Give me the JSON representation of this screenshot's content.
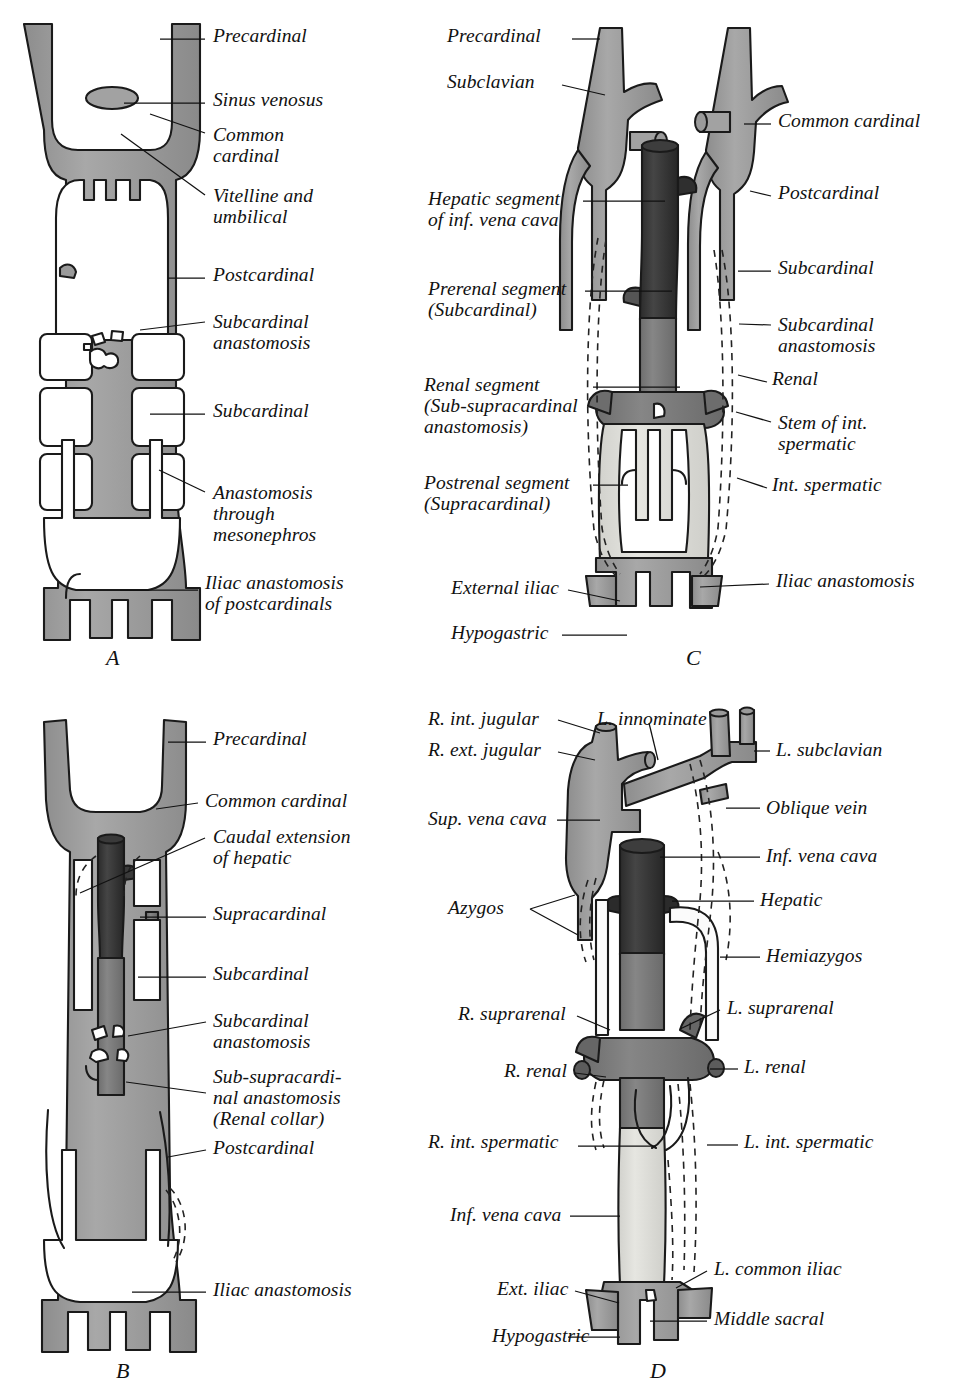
{
  "figure": {
    "colors": {
      "vessel_mid": "#9a9a9a",
      "vessel_dark": "#3a3a3a",
      "vessel_darker": "#2a2a2a",
      "vessel_light": "#d9d9d6",
      "vessel_pale": "#e8e8e4",
      "outline": "#1a1a1a",
      "background": "#ffffff",
      "text": "#111111"
    }
  },
  "panels": [
    {
      "id": "A",
      "letter": "A",
      "letter_pos": {
        "x": 106,
        "y": 645
      },
      "labels": [
        {
          "name": "precardinal",
          "text": "Precardinal",
          "x": 213,
          "y": 25,
          "align": "left",
          "leader": "M205,39 L160,39"
        },
        {
          "name": "sinus-venosus",
          "text": "Sinus venosus",
          "x": 213,
          "y": 89,
          "align": "left",
          "leader": "M205,103 L124,103"
        },
        {
          "name": "common-cardinal",
          "text": "Common\ncardinal",
          "x": 213,
          "y": 124,
          "align": "left",
          "leader": "M205,133 L150,114"
        },
        {
          "name": "vitelline-and-umbilical",
          "text": "Vitelline and\numbilical",
          "x": 213,
          "y": 185,
          "align": "left",
          "leader": "M205,195 L121,134"
        },
        {
          "name": "postcardinal",
          "text": "Postcardinal",
          "x": 213,
          "y": 264,
          "align": "left",
          "leader": "M205,278 L168,278"
        },
        {
          "name": "subcardinal-anastomosis",
          "text": "Subcardinal\nanastomosis",
          "x": 213,
          "y": 311,
          "align": "left",
          "leader": "M205,322 L140,330"
        },
        {
          "name": "subcardinal",
          "text": "Subcardinal",
          "x": 213,
          "y": 400,
          "align": "left",
          "leader": "M205,414 L150,414"
        },
        {
          "name": "anastomosis-through-mesonephros",
          "text": "Anastomosis\nthrough\nmesonephros",
          "x": 213,
          "y": 482,
          "align": "left",
          "leader": "M205,492 L159,470"
        },
        {
          "name": "iliac-anastomosis-of-postcardinals",
          "text": "Iliac anastomosis\nof postcardinals",
          "x": 205,
          "y": 572,
          "align": "left",
          "leader": "M198,590 L120,590"
        }
      ]
    },
    {
      "id": "B",
      "letter": "B",
      "letter_pos": {
        "x": 116,
        "y": 1360
      },
      "labels": [
        {
          "name": "precardinal",
          "text": "Precardinal",
          "x": 213,
          "y": 728,
          "align": "left",
          "leader": "M206,742 L168,742"
        },
        {
          "name": "common-cardinal",
          "text": "Common cardinal",
          "x": 205,
          "y": 790,
          "align": "left",
          "leader": "M198,803 L156,809"
        },
        {
          "name": "caudal-extension-of-hepatic",
          "text": "Caudal extension\nof hepatic",
          "x": 213,
          "y": 826,
          "align": "left",
          "leader": "M205,838 L80,893"
        },
        {
          "name": "supracardinal",
          "text": "Supracardinal",
          "x": 213,
          "y": 903,
          "align": "left",
          "leader": "M206,917 L140,917"
        },
        {
          "name": "subcardinal",
          "text": "Subcardinal",
          "x": 213,
          "y": 963,
          "align": "left",
          "leader": "M206,977 L138,977"
        },
        {
          "name": "subcardinal-anastomosis",
          "text": "Subcardinal\nanastomosis",
          "x": 213,
          "y": 1010,
          "align": "left",
          "leader": "M206,1022 L128,1036"
        },
        {
          "name": "sub-supracardinal-anastomosis",
          "text": "Sub-supracardi-\nnal anastomosis\n(Renal collar)",
          "x": 213,
          "y": 1066,
          "align": "left",
          "leader": "M206,1093 L126,1082"
        },
        {
          "name": "postcardinal",
          "text": "Postcardinal",
          "x": 213,
          "y": 1137,
          "align": "left",
          "leader": "M206,1150 L168,1157"
        },
        {
          "name": "iliac-anastomosis",
          "text": "Iliac anastomosis",
          "x": 213,
          "y": 1279,
          "align": "left",
          "leader": "M206,1292 L132,1292"
        }
      ]
    },
    {
      "id": "C",
      "letter": "C",
      "letter_pos": {
        "x": 686,
        "y": 645
      },
      "labels": [
        {
          "name": "precardinal",
          "text": "Precardinal",
          "x": 447,
          "y": 25,
          "align": "left",
          "leader": "M572,39 L600,39"
        },
        {
          "name": "subclavian",
          "text": "Subclavian",
          "x": 447,
          "y": 71,
          "align": "left",
          "leader": "M562,85 L605,95"
        },
        {
          "name": "hepatic-segment",
          "text": "Hepatic segment\nof inf. vena cava",
          "x": 428,
          "y": 188,
          "align": "left",
          "leader": "M583,201 L665,201"
        },
        {
          "name": "prerenal-segment",
          "text": "Prerenal segment\n(Subcardinal)",
          "x": 428,
          "y": 278,
          "align": "left",
          "leader": "M585,291 L672,291"
        },
        {
          "name": "renal-segment",
          "text": "Renal segment\n(Sub-supracardinal\nanastomosis)",
          "x": 424,
          "y": 374,
          "align": "left",
          "leader": "M593,387 L680,387"
        },
        {
          "name": "postrenal-segment",
          "text": "Postrenal segment\n(Supracardinal)",
          "x": 424,
          "y": 472,
          "align": "left",
          "leader": "M593,485 L628,485"
        },
        {
          "name": "external-iliac",
          "text": "External iliac",
          "x": 451,
          "y": 577,
          "align": "left",
          "leader": "M568,590 L620,601"
        },
        {
          "name": "hypogastric",
          "text": "Hypogastric",
          "x": 451,
          "y": 622,
          "align": "left",
          "leader": "M562,635 L627,635"
        },
        {
          "name": "common-cardinal",
          "text": "Common cardinal",
          "x": 778,
          "y": 110,
          "align": "left",
          "leader": "M771,124 L744,124"
        },
        {
          "name": "postcardinal",
          "text": "Postcardinal",
          "x": 778,
          "y": 182,
          "align": "left",
          "leader": "M771,196 L750,191"
        },
        {
          "name": "subcardinal",
          "text": "Subcardinal",
          "x": 778,
          "y": 257,
          "align": "left",
          "leader": "M771,271 L738,271"
        },
        {
          "name": "subcardinal-anastomosis",
          "text": "Subcardinal\nanastomosis",
          "x": 778,
          "y": 314,
          "align": "left",
          "leader": "M771,325 L739,324"
        },
        {
          "name": "renal",
          "text": "Renal",
          "x": 772,
          "y": 368,
          "align": "left",
          "leader": "M767,382 L738,375"
        },
        {
          "name": "stem-of-int-spermatic",
          "text": "Stem of int.\nspermatic",
          "x": 778,
          "y": 412,
          "align": "left",
          "leader": "M771,422 L736,412"
        },
        {
          "name": "int-spermatic",
          "text": "Int. spermatic",
          "x": 772,
          "y": 474,
          "align": "left",
          "leader": "M767,488 L737,478"
        },
        {
          "name": "iliac-anastomosis",
          "text": "Iliac anastomosis",
          "x": 776,
          "y": 570,
          "align": "left",
          "leader": "M769,584 L700,587"
        }
      ]
    },
    {
      "id": "D",
      "letter": "D",
      "letter_pos": {
        "x": 650,
        "y": 1360
      },
      "labels": [
        {
          "name": "r-int-jugular",
          "text": "R. int. jugular",
          "x": 428,
          "y": 708,
          "align": "left",
          "leader": "M558,720 L600,733"
        },
        {
          "name": "r-ext-jugular",
          "text": "R. ext. jugular",
          "x": 428,
          "y": 739,
          "align": "left",
          "leader": "M558,752 L595,760"
        },
        {
          "name": "l-innominate",
          "text": "L. innominate",
          "x": 597,
          "y": 708,
          "align": "left",
          "leader": "M649,723 L658,760"
        },
        {
          "name": "sup-vena-cava",
          "text": "Sup. vena cava",
          "x": 428,
          "y": 808,
          "align": "left",
          "leader": "M557,820 L600,820"
        },
        {
          "name": "azygos",
          "text": "Azygos",
          "x": 448,
          "y": 897,
          "align": "left",
          "leader": "M530,909 L575,895 M530,909 L578,935"
        },
        {
          "name": "l-subclavian",
          "text": "L. subclavian",
          "x": 776,
          "y": 739,
          "align": "left",
          "leader": "M770,751 L754,751"
        },
        {
          "name": "oblique-vein",
          "text": "Oblique vein",
          "x": 766,
          "y": 797,
          "align": "left",
          "leader": "M760,808 L726,808"
        },
        {
          "name": "inf-vena-cava-top",
          "text": "Inf. vena cava",
          "x": 766,
          "y": 845,
          "align": "left",
          "leader": "M760,857 L660,857"
        },
        {
          "name": "hepatic",
          "text": "Hepatic",
          "x": 760,
          "y": 889,
          "align": "left",
          "leader": "M754,901 L672,901"
        },
        {
          "name": "hemiazygos",
          "text": "Hemiazygos",
          "x": 766,
          "y": 945,
          "align": "left",
          "leader": "M760,957 L720,957"
        },
        {
          "name": "r-suprarenal",
          "text": "R. suprarenal",
          "x": 458,
          "y": 1003,
          "align": "left",
          "leader": "M577,1016 L610,1030"
        },
        {
          "name": "r-renal",
          "text": "R. renal",
          "x": 504,
          "y": 1060,
          "align": "left",
          "leader": "M575,1073 L606,1077"
        },
        {
          "name": "r-int-spermatic",
          "text": "R. int. spermatic",
          "x": 428,
          "y": 1131,
          "align": "left",
          "leader": "M578,1146 L656,1146"
        },
        {
          "name": "inf-vena-cava-bottom",
          "text": "Inf. vena cava",
          "x": 450,
          "y": 1204,
          "align": "left",
          "leader": "M570,1216 L620,1216"
        },
        {
          "name": "ext-iliac",
          "text": "Ext. iliac",
          "x": 497,
          "y": 1278,
          "align": "left",
          "leader": "M575,1291 L619,1303"
        },
        {
          "name": "hypogastric",
          "text": "Hypogastric",
          "x": 492,
          "y": 1325,
          "align": "left",
          "leader": "M568,1337 L620,1337"
        },
        {
          "name": "l-suprarenal",
          "text": "L. suprarenal",
          "x": 727,
          "y": 997,
          "align": "left",
          "leader": "M720,1010 L680,1029"
        },
        {
          "name": "l-renal",
          "text": "L. renal",
          "x": 744,
          "y": 1056,
          "align": "left",
          "leader": "M738,1069 L710,1069"
        },
        {
          "name": "l-int-spermatic",
          "text": "L. int. spermatic",
          "x": 744,
          "y": 1131,
          "align": "left",
          "leader": "M738,1145 L707,1145"
        },
        {
          "name": "l-common-iliac",
          "text": "L. common iliac",
          "x": 714,
          "y": 1258,
          "align": "left",
          "leader": "M707,1271 L676,1288"
        },
        {
          "name": "middle-sacral",
          "text": "Middle sacral",
          "x": 714,
          "y": 1308,
          "align": "left",
          "leader": "M707,1321 L650,1321"
        }
      ]
    }
  ]
}
